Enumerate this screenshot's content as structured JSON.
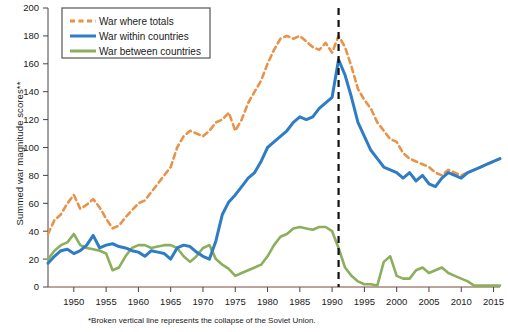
{
  "chart_data": {
    "type": "line",
    "title": "",
    "xlabel": "",
    "ylabel": "Summed war magnitude scores**",
    "footnote": "*Broken vertical line represents the collapse of the Soviet Union.",
    "xlim": [
      1946,
      2016
    ],
    "ylim": [
      0,
      200
    ],
    "ytick_step": 20,
    "xtick_step": 5,
    "grid": false,
    "legend_position": "top-left",
    "yticks": [
      0,
      20,
      40,
      60,
      80,
      100,
      120,
      140,
      160,
      180,
      200
    ],
    "xticks": [
      1950,
      1955,
      1960,
      1965,
      1970,
      1975,
      1980,
      1985,
      1990,
      1995,
      2000,
      2005,
      2010,
      2015
    ],
    "annotations": [
      {
        "name": "soviet-collapse-line",
        "type": "vline",
        "x": 1991,
        "style": "dashed",
        "color": "#111111",
        "label": "*Broken vertical line represents the collapse of the Soviet Union."
      }
    ],
    "x": [
      1946,
      1947,
      1948,
      1949,
      1950,
      1951,
      1952,
      1953,
      1954,
      1955,
      1956,
      1957,
      1958,
      1959,
      1960,
      1961,
      1962,
      1963,
      1964,
      1965,
      1966,
      1967,
      1968,
      1969,
      1970,
      1971,
      1972,
      1973,
      1974,
      1975,
      1976,
      1977,
      1978,
      1979,
      1980,
      1981,
      1982,
      1983,
      1984,
      1985,
      1986,
      1987,
      1988,
      1989,
      1990,
      1991,
      1992,
      1993,
      1994,
      1995,
      1996,
      1997,
      1998,
      1999,
      2000,
      2001,
      2002,
      2003,
      2004,
      2005,
      2006,
      2007,
      2008,
      2009,
      2010,
      2011,
      2012,
      2013,
      2014,
      2015,
      2016
    ],
    "series": [
      {
        "name": "War where totals",
        "key": "totals",
        "color": "#E8934A",
        "style": "dashed",
        "width": 2.6,
        "values": [
          38,
          48,
          52,
          60,
          66,
          56,
          59,
          63,
          57,
          49,
          42,
          44,
          50,
          55,
          60,
          62,
          68,
          74,
          80,
          86,
          100,
          108,
          112,
          110,
          108,
          112,
          118,
          120,
          125,
          112,
          120,
          132,
          140,
          148,
          160,
          170,
          178,
          180,
          178,
          180,
          176,
          172,
          170,
          175,
          168,
          180,
          172,
          158,
          142,
          134,
          128,
          118,
          112,
          106,
          104,
          96,
          92,
          90,
          88,
          86,
          82,
          80,
          84,
          82,
          80,
          82,
          84,
          86,
          88,
          90,
          92
        ]
      },
      {
        "name": "War within countries",
        "key": "within",
        "color": "#2E7DC4",
        "style": "solid",
        "width": 3.0,
        "values": [
          17,
          22,
          26,
          27,
          24,
          26,
          30,
          37,
          28,
          30,
          31,
          29,
          28,
          26,
          25,
          22,
          26,
          25,
          24,
          20,
          28,
          30,
          29,
          25,
          22,
          20,
          33,
          52,
          61,
          66,
          72,
          78,
          82,
          90,
          100,
          104,
          108,
          112,
          118,
          122,
          120,
          122,
          128,
          132,
          136,
          163,
          152,
          136,
          118,
          108,
          98,
          92,
          86,
          84,
          82,
          78,
          82,
          76,
          80,
          74,
          72,
          78,
          82,
          80,
          78,
          82,
          84,
          86,
          88,
          90,
          92
        ]
      },
      {
        "name": "War between countries",
        "key": "between",
        "color": "#8BAF5C",
        "style": "solid",
        "width": 2.6,
        "values": [
          20,
          26,
          30,
          32,
          38,
          30,
          28,
          27,
          26,
          24,
          12,
          14,
          22,
          28,
          30,
          30,
          28,
          29,
          30,
          30,
          28,
          22,
          18,
          22,
          28,
          30,
          20,
          16,
          13,
          8,
          10,
          12,
          14,
          16,
          22,
          30,
          36,
          38,
          42,
          43,
          42,
          41,
          43,
          43,
          40,
          28,
          14,
          8,
          4,
          2,
          2,
          1,
          18,
          22,
          8,
          6,
          6,
          12,
          14,
          10,
          12,
          14,
          10,
          8,
          6,
          4,
          1,
          1,
          1,
          1,
          1
        ]
      }
    ]
  },
  "legend": {
    "items": [
      {
        "label": "War where totals",
        "color": "#E8934A",
        "style": "dashed"
      },
      {
        "label": "War within countries",
        "color": "#2E7DC4",
        "style": "solid"
      },
      {
        "label": "War between countries",
        "color": "#8BAF5C",
        "style": "solid"
      }
    ]
  },
  "axes": {
    "y_axis_title": "Summed war magnitude scores**"
  },
  "footnote_text": "*Broken vertical line represents the collapse of the Soviet Union."
}
